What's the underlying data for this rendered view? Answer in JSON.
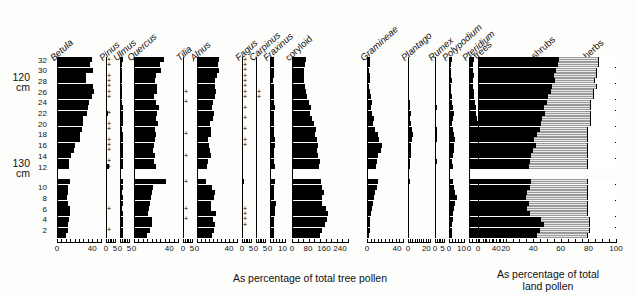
{
  "depth": {
    "axis_name": "depth-axis",
    "levels": [
      32,
      30,
      28,
      26,
      24,
      22,
      20,
      18,
      16,
      14,
      12,
      10,
      8,
      6,
      4,
      2
    ],
    "cm_markers": [
      {
        "label_line1": "120",
        "label_line2": "cm",
        "at_level": 28
      },
      {
        "label_line1": "130",
        "label_line2": "cm",
        "at_level": 11
      }
    ],
    "hiatus_between": [
      8,
      6
    ]
  },
  "captions": {
    "tree_pollen": "As percentage of total tree pollen",
    "land_pollen_line1": "As percentage of total",
    "land_pollen_line2": "land pollen"
  },
  "summary": {
    "labels": [
      "trees",
      "shrubs",
      "herbs"
    ],
    "axis_ticks": [
      0,
      20,
      40,
      60,
      80,
      100
    ],
    "colors": {
      "trees": "#000000",
      "shrubs": "#9a9a9a",
      "herbs": "#ffffff"
    }
  },
  "chart_data": {
    "type": "area",
    "xlabel": "As percentage of total tree pollen",
    "ylabel": "depth (cm)",
    "categories": [
      32,
      30,
      28,
      26,
      24,
      22,
      20,
      18,
      16,
      14,
      12,
      10,
      8,
      6,
      4,
      2
    ],
    "grid": false,
    "legend": "none",
    "taxa": [
      {
        "name": "Betula",
        "style": "italic",
        "xmax": 50,
        "ticks": [
          0,
          40
        ],
        "tick_labels": [
          "0",
          "40"
        ],
        "width_px": 44,
        "values": [
          40,
          38,
          41,
          33,
          33,
          41,
          42,
          40,
          36,
          35,
          34,
          30,
          30,
          28,
          26,
          26,
          21,
          19,
          16,
          14,
          14,
          15,
          13,
          12,
          11,
          13,
          15,
          15,
          14,
          13,
          12,
          10
        ],
        "traces": []
      },
      {
        "name": "Pinus",
        "style": "italic",
        "xmax": 5,
        "ticks": [
          0,
          5
        ],
        "tick_labels": [
          "0",
          "5"
        ],
        "width_px": 9,
        "values": [
          0,
          0,
          0,
          0,
          0,
          0,
          0,
          0,
          0,
          0,
          1.2,
          0,
          0,
          0,
          0,
          0,
          0,
          0,
          0,
          0,
          1.4,
          0,
          0,
          0,
          0,
          0,
          0,
          0,
          0,
          0,
          0,
          0
        ],
        "traces": [
          32,
          31,
          29,
          28,
          27,
          26,
          25,
          22,
          20,
          19,
          17,
          16,
          15,
          13,
          12,
          6,
          2
        ]
      },
      {
        "name": "Ulmus",
        "style": "italic",
        "xmax": 5,
        "ticks": [
          0,
          5
        ],
        "tick_labels": [
          "0",
          "5"
        ],
        "width_px": 9,
        "values": [
          1.4,
          1.0,
          0.9,
          1.0,
          1.1,
          0.9,
          1.0,
          1.1,
          1.2,
          1.4,
          1.6,
          1.5,
          1.4,
          1.3,
          1.5,
          1.6,
          1.8,
          1.6,
          1.5,
          1.4,
          1.6,
          1.5,
          1.4,
          1.3,
          1.6,
          1.4,
          1.3,
          1.5,
          1.7,
          1.6,
          1.5,
          1.4
        ],
        "traces": []
      },
      {
        "name": "Quercus",
        "style": "italic",
        "xmax": 50,
        "ticks": [
          0,
          40
        ],
        "tick_labels": [
          "0",
          "40"
        ],
        "width_px": 44,
        "values": [
          34,
          30,
          31,
          25,
          24,
          26,
          26,
          23,
          25,
          28,
          26,
          25,
          27,
          24,
          25,
          24,
          23,
          22,
          24,
          23,
          25,
          36,
          22,
          20,
          19,
          18,
          17,
          16,
          21,
          20,
          18,
          15
        ],
        "traces": []
      },
      {
        "name": "Tilia",
        "style": "italic",
        "xmax": 5,
        "ticks": [
          0,
          5
        ],
        "tick_labels": [
          "0",
          "5"
        ],
        "width_px": 9,
        "values": [
          0,
          0,
          0,
          0,
          0,
          0,
          0,
          0,
          0,
          0,
          0,
          0,
          0,
          0,
          0,
          0,
          0,
          0,
          0,
          0,
          0,
          0,
          0,
          0,
          0,
          0,
          0,
          0,
          0,
          0,
          0,
          0
        ],
        "traces": [
          26,
          24,
          18,
          14,
          11,
          6,
          4
        ]
      },
      {
        "name": "Alnus",
        "style": "italic",
        "xmax": 50,
        "ticks": [
          0,
          40
        ],
        "tick_labels": [
          "0",
          "40"
        ],
        "width_px": 40,
        "values": [
          27,
          26,
          28,
          25,
          22,
          22,
          24,
          23,
          20,
          19,
          21,
          20,
          16,
          17,
          18,
          14,
          15,
          16,
          18,
          14,
          13,
          11,
          19,
          22,
          21,
          17,
          18,
          24,
          20,
          22,
          21,
          19
        ],
        "traces": []
      },
      {
        "name": "Fagus",
        "style": "italic",
        "xmax": 5,
        "ticks": [
          0,
          5
        ],
        "tick_labels": [
          "0",
          "5"
        ],
        "width_px": 9,
        "values": [
          0,
          0,
          0,
          0,
          0,
          0,
          0,
          0,
          0,
          0,
          0,
          0,
          0,
          0,
          0,
          0,
          0,
          0,
          0,
          0,
          0,
          1.0,
          0,
          0,
          0,
          0,
          0,
          0,
          0,
          0,
          0,
          0
        ],
        "traces": [
          32,
          31,
          30,
          29,
          28,
          27,
          26,
          25,
          23,
          21,
          19,
          17,
          16,
          6,
          5,
          4,
          3
        ]
      },
      {
        "name": "Carpinus",
        "style": "italic",
        "xmax": 5,
        "ticks": [
          0,
          5
        ],
        "tick_labels": [
          "0",
          "5"
        ],
        "width_px": 9,
        "values": [
          0,
          0,
          0,
          0,
          0,
          0,
          0,
          0,
          0,
          0,
          0,
          0,
          0,
          0,
          0,
          0,
          0,
          0,
          0,
          0,
          0,
          0,
          0,
          0,
          0,
          0,
          0,
          0,
          0,
          0,
          0,
          0
        ],
        "traces": [
          26,
          25
        ]
      },
      {
        "name": "Fraxinus",
        "style": "italic",
        "xmax": 12,
        "ticks": [
          0,
          10
        ],
        "tick_labels": [
          "0",
          "10"
        ],
        "width_px": 15,
        "values": [
          3.0,
          2.8,
          3.2,
          3.0,
          2.6,
          3.4,
          3.0,
          2.8,
          3.2,
          3.6,
          3.0,
          2.8,
          3.4,
          3.0,
          3.2,
          3.6,
          3.8,
          3.4,
          3.0,
          3.2,
          4.0,
          3.6,
          3.4,
          3.0,
          3.2,
          5.0,
          4.0,
          3.6,
          3.2,
          3.0,
          3.4,
          3.0
        ],
        "traces": []
      },
      {
        "name": "coryloid",
        "style": "normal",
        "xmax": 280,
        "ticks": [
          0,
          80,
          160,
          240
        ],
        "tick_labels": [
          "0",
          "80",
          "160",
          "240"
        ],
        "width_px": 56,
        "values": [
          72,
          66,
          60,
          62,
          58,
          64,
          70,
          76,
          86,
          96,
          90,
          100,
          112,
          120,
          116,
          124,
          130,
          126,
          132,
          140,
          136,
          146,
          152,
          160,
          150,
          148,
          170,
          182,
          176,
          164,
          150,
          140
        ],
        "traces": []
      },
      {
        "name": "Gramineae",
        "style": "italic",
        "xmax": 48,
        "ticks": [
          0,
          40
        ],
        "tick_labels": [
          "0",
          "40"
        ],
        "width_px": 36,
        "values": [
          4,
          3.5,
          3,
          4,
          3.5,
          3,
          4,
          5,
          6,
          5,
          7,
          9,
          8,
          10,
          14,
          16,
          20,
          18,
          15,
          13,
          12,
          14,
          13,
          11,
          9,
          8,
          7,
          5,
          4,
          4,
          3.5,
          3
        ],
        "traces": []
      },
      {
        "name": "Plantago",
        "style": "italic",
        "xmax": 24,
        "ticks": [
          0,
          20
        ],
        "tick_labels": [
          "0",
          "20"
        ],
        "width_px": 22,
        "values": [
          1.5,
          1.2,
          1.0,
          1.4,
          1.2,
          1.0,
          1.2,
          1.4,
          1.8,
          2.2,
          3.0,
          2.6,
          3.4,
          4.0,
          5.0,
          4.4,
          3.8,
          3.2,
          2.8,
          2.4,
          2.0,
          1.8,
          1.6,
          1.4,
          1.2,
          1.0,
          0.9,
          0.8,
          0.7,
          0.8,
          0.9,
          1.0
        ],
        "traces": []
      },
      {
        "name": "Rumex",
        "style": "italic",
        "xmax": 6,
        "ticks": [
          0,
          5
        ],
        "tick_labels": [
          "0",
          "5"
        ],
        "width_px": 9,
        "values": [
          0.8,
          0.6,
          0.7,
          0.6,
          0.5,
          0.6,
          0.7,
          0.8,
          0.9,
          1.0,
          0.9,
          0.8,
          0.9,
          1.0,
          1.1,
          1.0,
          0.9,
          0.8,
          0.9,
          1.0,
          0.9,
          0.8,
          0.7,
          0.6,
          0.7,
          0.8,
          0.7,
          0.6,
          0.7,
          0.8,
          0.9,
          0.8
        ],
        "traces": []
      },
      {
        "name": "Polypodium",
        "style": "italic",
        "xmax": 12,
        "ticks": [
          0,
          10
        ],
        "tick_labels": [
          "0",
          "10"
        ],
        "width_px": 15,
        "values": [
          2.0,
          1.6,
          1.4,
          1.8,
          2.0,
          1.6,
          1.4,
          2.0,
          2.4,
          3.0,
          3.6,
          3.0,
          2.6,
          3.4,
          4.0,
          4.6,
          4.0,
          3.6,
          3.0,
          2.6,
          3.0,
          3.4,
          4.0,
          5.0,
          6.0,
          5.0,
          4.0,
          3.4,
          3.0,
          2.6,
          2.4,
          2.0
        ],
        "traces": []
      },
      {
        "name": "Pteridium",
        "style": "italic",
        "xmax": 50,
        "ticks": [
          0,
          40
        ],
        "tick_labels": [
          "0",
          "40"
        ],
        "width_px": 34,
        "values": [
          7,
          6,
          6.5,
          7,
          6,
          6.5,
          7,
          8,
          9,
          10,
          11,
          12,
          13,
          14,
          16,
          18,
          20,
          22,
          24,
          26,
          28,
          26,
          24,
          26,
          28,
          30,
          28,
          26,
          22,
          20,
          18,
          16
        ],
        "traces": []
      }
    ],
    "summary_series": {
      "trees": [
        58,
        57,
        56,
        54,
        55,
        53,
        52,
        50,
        49,
        47,
        48,
        46,
        45,
        44,
        42,
        40,
        41,
        39,
        38,
        37,
        36,
        38,
        37,
        35,
        34,
        36,
        35,
        37,
        45,
        47,
        44,
        42
      ],
      "shrubs": [
        30,
        31,
        30,
        32,
        30,
        33,
        32,
        34,
        33,
        35,
        34,
        36,
        37,
        36,
        38,
        40,
        39,
        41,
        42,
        43,
        44,
        42,
        43,
        45,
        46,
        44,
        45,
        43,
        36,
        34,
        37,
        38
      ],
      "herbs": [
        12,
        12,
        14,
        14,
        15,
        14,
        16,
        16,
        18,
        18,
        18,
        18,
        18,
        20,
        20,
        20,
        20,
        20,
        20,
        20,
        20,
        20,
        20,
        20,
        20,
        20,
        20,
        20,
        19,
        19,
        19,
        20
      ]
    }
  }
}
